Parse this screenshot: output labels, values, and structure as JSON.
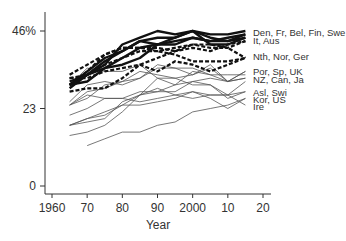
{
  "chart_data": {
    "type": "line",
    "title": "",
    "xlabel": "Year",
    "ylabel": "",
    "xlim": [
      1958,
      2022
    ],
    "ylim": [
      0,
      46
    ],
    "x_ticks": [
      {
        "value": 1960,
        "label": "1960"
      },
      {
        "value": 1970,
        "label": "70"
      },
      {
        "value": 1980,
        "label": "80"
      },
      {
        "value": 1990,
        "label": "90"
      },
      {
        "value": 2000,
        "label": "2000"
      },
      {
        "value": 2010,
        "label": "10"
      },
      {
        "value": 2020,
        "label": "20"
      }
    ],
    "y_ticks": [
      {
        "value": 0,
        "label": "0"
      },
      {
        "value": 23,
        "label": "23"
      },
      {
        "value": 46,
        "label": "46%"
      }
    ],
    "grid": false,
    "legend_position": "direct labels at right end of lines",
    "group_labels": [
      {
        "text": "Den, Fr, Bel, Fin, Swe",
        "y_value": 45.5
      },
      {
        "text": "It, Aus",
        "y_value": 43.2
      },
      {
        "text": "Nth, Nor, Ger",
        "y_value": 38.5
      },
      {
        "text": "Por, Sp, UK",
        "y_value": 34.0
      },
      {
        "text": "NZ, Can, Ja",
        "y_value": 31.7
      },
      {
        "text": "Asl, Swi",
        "y_value": 27.8
      },
      {
        "text": "Kor, US",
        "y_value": 25.8
      },
      {
        "text": "Ire",
        "y_value": 23.5
      }
    ],
    "x": [
      1965,
      1970,
      1975,
      1980,
      1985,
      1990,
      1995,
      2000,
      2005,
      2010,
      2015
    ],
    "series": [
      {
        "name": "Den",
        "style": "thick",
        "values": [
          29,
          33,
          36,
          42,
          44,
          46,
          45,
          46,
          45,
          45,
          46
        ]
      },
      {
        "name": "Swe",
        "style": "thick",
        "values": [
          30,
          34,
          38,
          40,
          43,
          44,
          44,
          46,
          44,
          43,
          44
        ]
      },
      {
        "name": "Fr",
        "style": "thick",
        "values": [
          31,
          33,
          35,
          38,
          41,
          42,
          42,
          44,
          43,
          44,
          45
        ]
      },
      {
        "name": "Bel",
        "style": "thick",
        "values": [
          30,
          33,
          37,
          40,
          43,
          42,
          43,
          44,
          43,
          43,
          45
        ]
      },
      {
        "name": "Fin",
        "style": "thick",
        "values": [
          30,
          31,
          35,
          36,
          38,
          42,
          44,
          46,
          42,
          42,
          44
        ]
      },
      {
        "name": "It",
        "style": "dashed",
        "values": [
          28,
          29,
          29,
          32,
          36,
          38,
          40,
          41,
          40,
          42,
          43
        ]
      },
      {
        "name": "Aus",
        "style": "dashed",
        "values": [
          32,
          33,
          36,
          38,
          40,
          40,
          41,
          42,
          41,
          41,
          43
        ]
      },
      {
        "name": "Nth",
        "style": "dashed",
        "values": [
          33,
          36,
          39,
          41,
          41,
          40,
          39,
          37,
          37,
          37,
          38
        ]
      },
      {
        "name": "Nor",
        "style": "dashed",
        "values": [
          30,
          34,
          39,
          41,
          41,
          41,
          40,
          42,
          42,
          41,
          38
        ]
      },
      {
        "name": "Ger",
        "style": "dashed",
        "values": [
          32,
          32,
          34,
          35,
          36,
          34,
          37,
          36,
          34,
          36,
          38
        ]
      },
      {
        "name": "Por",
        "style": "thin",
        "values": [
          18,
          20,
          21,
          24,
          27,
          28,
          30,
          31,
          32,
          31,
          34
        ]
      },
      {
        "name": "Sp",
        "style": "thin",
        "values": [
          15,
          16,
          18,
          22,
          27,
          32,
          32,
          33,
          35,
          31,
          34
        ]
      },
      {
        "name": "UK",
        "style": "thin",
        "values": [
          30,
          35,
          34,
          34,
          36,
          32,
          30,
          34,
          33,
          33,
          33
        ]
      },
      {
        "name": "NZ",
        "style": "thin",
        "values": [
          24,
          26,
          30,
          31,
          32,
          36,
          35,
          33,
          36,
          31,
          32
        ]
      },
      {
        "name": "Can",
        "style": "thin",
        "values": [
          25,
          30,
          31,
          30,
          32,
          35,
          35,
          35,
          33,
          31,
          32
        ]
      },
      {
        "name": "Ja",
        "style": "thin",
        "values": [
          18,
          19,
          20,
          25,
          27,
          29,
          27,
          26,
          27,
          27,
          31
        ]
      },
      {
        "name": "Asl",
        "style": "thin",
        "values": [
          21,
          23,
          26,
          26,
          28,
          28,
          28,
          31,
          30,
          26,
          28
        ]
      },
      {
        "name": "Swi",
        "style": "thin",
        "values": [
          18,
          20,
          22,
          24,
          24,
          25,
          26,
          28,
          27,
          27,
          28
        ]
      },
      {
        "name": "Kor",
        "style": "thin",
        "values": [
          null,
          12,
          14,
          16,
          16,
          18,
          19,
          22,
          23,
          24,
          26
        ]
      },
      {
        "name": "US",
        "style": "thin",
        "values": [
          24,
          27,
          26,
          26,
          25,
          26,
          27,
          28,
          26,
          23,
          26
        ]
      },
      {
        "name": "Ire",
        "style": "thin",
        "values": [
          24,
          28,
          29,
          31,
          34,
          33,
          32,
          30,
          30,
          27,
          24
        ]
      }
    ]
  }
}
